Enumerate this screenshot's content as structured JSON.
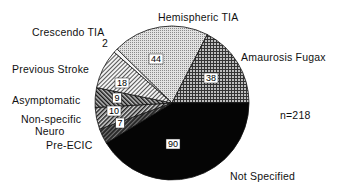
{
  "chart_data": {
    "type": "pie",
    "title": "",
    "annotation": "n=218",
    "total": 218,
    "start_angle_deg": -138.74,
    "direction": "clockwise",
    "slices": [
      {
        "label": "Crescendo TIA",
        "value": 2,
        "pattern": "white-stripe"
      },
      {
        "label": "Hemispheric TIA",
        "value": 44,
        "pattern": "fine-dots-light"
      },
      {
        "label": "Amaurosis Fugax",
        "value": 38,
        "pattern": "grid-dark"
      },
      {
        "label": "Not Specified",
        "value": 90,
        "pattern": "solid-black"
      },
      {
        "label": "Pre-ECIC",
        "value": 7,
        "pattern": "dark-hatch"
      },
      {
        "label": "Non-specific Neuro",
        "value": 10,
        "pattern": "diag-hatch-medium"
      },
      {
        "label": "Asymptomatic",
        "value": 9,
        "pattern": "cross-hatch"
      },
      {
        "label": "Previous Stroke",
        "value": 18,
        "pattern": "diag-hatch-light"
      }
    ],
    "labels": [
      {
        "text": "Crescendo TIA",
        "x": 32,
        "y": 36
      },
      {
        "text": "Hemispheric TIA",
        "x": 158,
        "y": 21
      },
      {
        "text": "Amaurosis Fugax",
        "x": 241,
        "y": 61
      },
      {
        "text": "Previous Stroke",
        "x": 12,
        "y": 73
      },
      {
        "text": "Asymptomatic",
        "x": 12,
        "y": 104
      },
      {
        "text": "Non-specific",
        "x": 21,
        "y": 123
      },
      {
        "text": "Neuro",
        "x": 35,
        "y": 135
      },
      {
        "text": "Pre-ECIC",
        "x": 46,
        "y": 149
      },
      {
        "text": "Not Specified",
        "x": 230,
        "y": 180
      },
      {
        "text": "n=218",
        "x": 280,
        "y": 119
      },
      {
        "text": "2",
        "x": 102,
        "y": 47
      }
    ],
    "value_labels": [
      {
        "text": "44",
        "x": 156,
        "y": 62
      },
      {
        "text": "38",
        "x": 211,
        "y": 81
      },
      {
        "text": "18",
        "x": 122,
        "y": 86
      },
      {
        "text": "9",
        "x": 117,
        "y": 101
      },
      {
        "text": "10",
        "x": 114,
        "y": 114
      },
      {
        "text": "7",
        "x": 120,
        "y": 126
      },
      {
        "text": "90",
        "x": 173,
        "y": 147
      }
    ]
  }
}
